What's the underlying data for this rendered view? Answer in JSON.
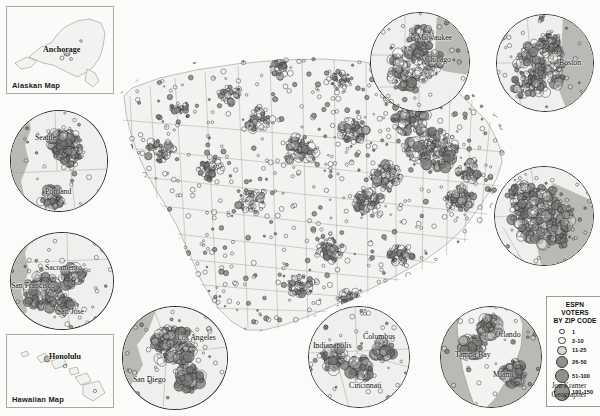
{
  "map": {
    "title": "ESPN Voters by Zip Code",
    "background_color": "#fbfbfa",
    "land_color": "#f2f2f0",
    "water_color": "#b9b9b6",
    "outline_color": "#8d8d8a"
  },
  "legend": {
    "title_line1": "ESPN VOTERS",
    "title_line2": "BY ZIP CODE",
    "classes": [
      {
        "label": "1",
        "radius": 1.6
      },
      {
        "label": "2-10",
        "radius": 2.6
      },
      {
        "label": "11-25",
        "radius": 3.6
      },
      {
        "label": "26-50",
        "radius": 5.0
      },
      {
        "label": "51-100",
        "radius": 6.2
      },
      {
        "label": "101-150",
        "radius": 7.4
      }
    ]
  },
  "credit": {
    "name": "Jon Kramer",
    "role": "Geographer"
  },
  "rect_insets": [
    {
      "name": "alaska",
      "caption": "Alaskan Map",
      "cities": [
        {
          "label": "Anchorage",
          "x": 42,
          "y": 38
        }
      ]
    },
    {
      "name": "hawaii",
      "caption": "Hawaiian Map",
      "cities": [
        {
          "label": "Honolulu",
          "x": 40,
          "y": 18
        }
      ]
    }
  ],
  "circle_insets": [
    {
      "name": "chicago-milwaukee",
      "cities": [
        {
          "label": "Milwaukee",
          "x": 47,
          "y": 21
        },
        {
          "label": "Chicago",
          "x": 52,
          "y": 42
        }
      ]
    },
    {
      "name": "boston",
      "cities": [
        {
          "label": "Boston",
          "x": 63,
          "y": 44
        }
      ]
    },
    {
      "name": "new-york",
      "cities": []
    },
    {
      "name": "seattle-portland",
      "cities": [
        {
          "label": "Seattle",
          "x": 28,
          "y": 24
        },
        {
          "label": "Portland",
          "x": 38,
          "y": 80
        }
      ]
    },
    {
      "name": "bay-area",
      "cities": [
        {
          "label": "Sacramento",
          "x": 36,
          "y": 33
        },
        {
          "label": "San Francisco",
          "x": 2,
          "y": 51
        },
        {
          "label": "San Jose",
          "x": 48,
          "y": 78
        }
      ]
    },
    {
      "name": "southern-california",
      "cities": [
        {
          "label": "Los Angeles",
          "x": 58,
          "y": 29
        },
        {
          "label": "San Diego",
          "x": 16,
          "y": 70
        }
      ]
    },
    {
      "name": "ohio-valley",
      "cities": [
        {
          "label": "Indianapolis",
          "x": 8,
          "y": 36
        },
        {
          "label": "Columbus",
          "x": 57,
          "y": 27
        },
        {
          "label": "Cincinnati",
          "x": 43,
          "y": 76
        }
      ]
    },
    {
      "name": "florida",
      "cities": [
        {
          "label": "Orlando",
          "x": 57,
          "y": 25
        },
        {
          "label": "Tampa Bay",
          "x": 17,
          "y": 45
        },
        {
          "label": "Miami",
          "x": 55,
          "y": 66
        }
      ]
    }
  ]
}
